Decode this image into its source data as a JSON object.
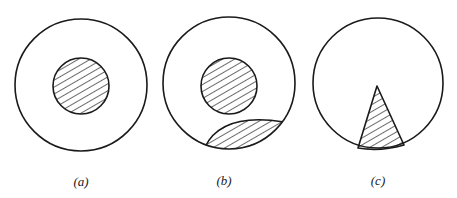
{
  "figures": [
    {
      "id": "a",
      "label": "(a)",
      "description": "Circle with small hatched concentric disk at center"
    },
    {
      "id": "b",
      "label": "(b)",
      "description": "Circle with hatched central disk and hatched lens-shaped segment at bottom"
    },
    {
      "id": "c",
      "label": "(c)",
      "description": "Circle with hatched triangular wedge rising from the bottom edge"
    }
  ],
  "colors": {
    "stroke": "#1a1a1a",
    "background": "#ffffff",
    "hatch": "#1a1a1a"
  }
}
